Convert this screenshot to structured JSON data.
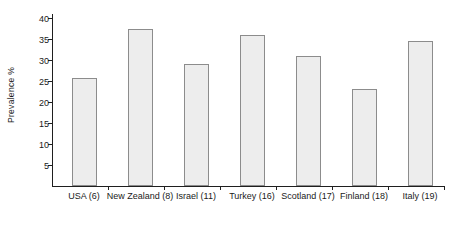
{
  "chart_data": {
    "type": "bar",
    "title": "",
    "xlabel": "",
    "ylabel": "Prevalence  %",
    "categories": [
      "USA (6)",
      "New Zealand (8)",
      "Israel (11)",
      "Turkey (16)",
      "Scotland (17)",
      "Finland (18)",
      "Italy (19)"
    ],
    "values": [
      25.8,
      37.5,
      29.1,
      36.0,
      30.9,
      23.2,
      34.5
    ],
    "ylim": [
      0,
      41
    ],
    "yticks": [
      5,
      10,
      15,
      20,
      25,
      30,
      35,
      40
    ],
    "ytick_labels": [
      "5",
      "10",
      "15",
      "20",
      "25",
      "30",
      "35",
      "40"
    ],
    "grid": false,
    "legend": false,
    "bar_fill": "#ededed",
    "bar_border": "#8c8c8c",
    "axis_color": "#1f1f1f"
  }
}
